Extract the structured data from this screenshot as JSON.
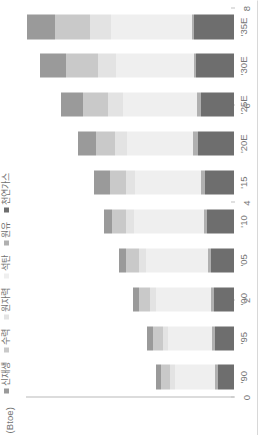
{
  "axis": {
    "unit_label": "(Btoe)",
    "y_ticks": [
      "0",
      "2",
      "4",
      "6",
      "8"
    ],
    "y_tick_values": [
      0,
      2,
      4,
      6,
      8
    ],
    "ylim": [
      0,
      8
    ]
  },
  "legend": {
    "items": [
      {
        "label": "신재생",
        "color": "#9a9a9a"
      },
      {
        "label": "수력",
        "color": "#c9c9c9"
      },
      {
        "label": "원자력",
        "color": "#e3e3e3"
      },
      {
        "label": "석탄",
        "color": "#efefef"
      },
      {
        "label": "원유",
        "color": "#b0b0b0"
      },
      {
        "label": "천연가스",
        "color": "#6e6e6e"
      }
    ]
  },
  "chart_data": {
    "type": "bar",
    "title": "",
    "subtitle": "",
    "xlabel": "",
    "ylabel": "(Btoe)",
    "ylim": [
      0,
      8
    ],
    "grid": false,
    "legend_position": "top-left",
    "orientation": "vertical",
    "stacked": true,
    "categories": [
      "'90",
      "'95",
      "'00",
      "'05",
      "'10",
      "'15",
      "'20E",
      "'25E",
      "'30E",
      "'35E"
    ],
    "series": [
      {
        "name": "천연가스",
        "color": "#6e6e6e",
        "values": [
          0.62,
          0.72,
          0.78,
          0.88,
          1.02,
          1.12,
          1.4,
          1.28,
          1.45,
          1.55
        ]
      },
      {
        "name": "원유",
        "color": "#b0b0b0",
        "values": [
          0.1,
          0.12,
          0.12,
          0.12,
          0.13,
          0.14,
          0.16,
          0.13,
          0.1,
          0.08
        ]
      },
      {
        "name": "석탄",
        "color": "#efefef",
        "values": [
          1.55,
          1.7,
          2.1,
          2.4,
          2.7,
          2.55,
          2.55,
          2.85,
          3.0,
          3.1
        ]
      },
      {
        "name": "원자력",
        "color": "#e3e3e3",
        "values": [
          0.18,
          0.2,
          0.22,
          0.26,
          0.3,
          0.36,
          0.45,
          0.6,
          0.7,
          0.8
        ]
      },
      {
        "name": "수력",
        "color": "#c9c9c9",
        "values": [
          0.35,
          0.38,
          0.42,
          0.48,
          0.55,
          0.6,
          0.75,
          0.95,
          1.2,
          1.35
        ]
      },
      {
        "name": "신재생",
        "color": "#9a9a9a",
        "values": [
          0.2,
          0.24,
          0.26,
          0.28,
          0.32,
          0.6,
          0.7,
          0.85,
          1.0,
          1.1
        ]
      }
    ],
    "totals": [
      3.0,
      3.36,
      3.9,
      4.42,
      5.02,
      5.37,
      6.01,
      6.66,
      7.45,
      7.98
    ]
  }
}
